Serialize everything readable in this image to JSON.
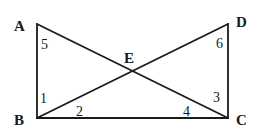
{
  "diagram": {
    "type": "geometry",
    "points": [
      {
        "label": "A",
        "x": 37,
        "y": 24,
        "lx": 14,
        "ly": 31
      },
      {
        "label": "B",
        "x": 37,
        "y": 118,
        "lx": 14,
        "ly": 125
      },
      {
        "label": "C",
        "x": 228,
        "y": 118,
        "lx": 236,
        "ly": 125
      },
      {
        "label": "D",
        "x": 228,
        "y": 24,
        "lx": 236,
        "ly": 27
      },
      {
        "label": "E",
        "x": 132,
        "y": 70,
        "lx": 124,
        "ly": 63
      }
    ],
    "segments": [
      [
        "A",
        "B"
      ],
      [
        "B",
        "C"
      ],
      [
        "C",
        "D"
      ],
      [
        "A",
        "C"
      ],
      [
        "B",
        "D"
      ]
    ],
    "angles": [
      {
        "label": "5",
        "x": 41,
        "y": 49
      },
      {
        "label": "1",
        "x": 40,
        "y": 103
      },
      {
        "label": "2",
        "x": 76,
        "y": 116
      },
      {
        "label": "4",
        "x": 183,
        "y": 116
      },
      {
        "label": "3",
        "x": 213,
        "y": 102
      },
      {
        "label": "6",
        "x": 216,
        "y": 48
      }
    ],
    "line_color": "#1a1a1a"
  }
}
